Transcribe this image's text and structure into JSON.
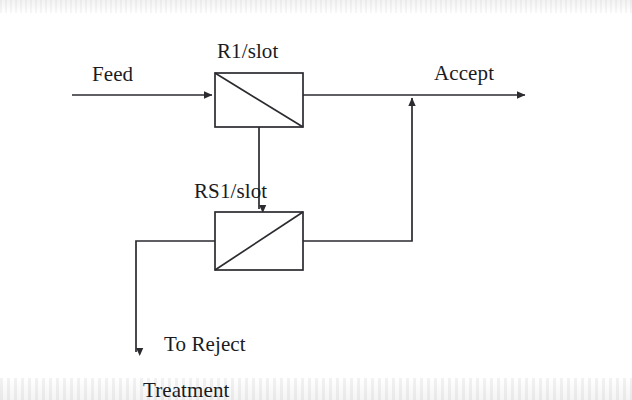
{
  "diagram": {
    "stroke_color": "#2b2b30",
    "background_color": "#ffffff",
    "labels": {
      "feed": "Feed",
      "accept": "Accept",
      "stage1": "R1/slot",
      "stage2": "RS1/slot",
      "reject_line1": "To Reject",
      "reject_line2": "Treatment"
    },
    "nodes": [
      {
        "id": "r1",
        "label": "R1/slot",
        "shape": "screen-box",
        "diagonal": "top-left-to-bottom-right",
        "x": 215,
        "y": 73,
        "width": 88,
        "height": 54
      },
      {
        "id": "rs1",
        "label": "RS1/slot",
        "shape": "screen-box",
        "diagonal": "bottom-left-to-top-right",
        "x": 215,
        "y": 212,
        "width": 88,
        "height": 58
      }
    ],
    "edges": [
      {
        "id": "feed-to-r1",
        "from": "feed-source",
        "to": "r1",
        "label": "Feed",
        "arrowhead": "end"
      },
      {
        "id": "r1-to-accept",
        "from": "r1",
        "to": "accept-sink",
        "label": "Accept",
        "arrowhead": "end"
      },
      {
        "id": "r1-to-rs1",
        "from": "r1",
        "to": "rs1",
        "label": "RS1/slot",
        "arrowhead": "end"
      },
      {
        "id": "rs1-to-accept",
        "from": "rs1",
        "to": "accept-line",
        "label": "",
        "arrowhead": "end"
      },
      {
        "id": "rs1-to-reject",
        "from": "rs1",
        "to": "reject-sink",
        "label": "To Reject Treatment",
        "arrowhead": "end"
      }
    ]
  }
}
